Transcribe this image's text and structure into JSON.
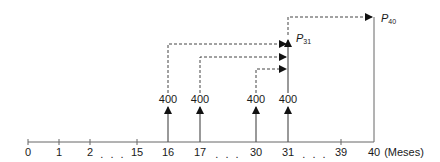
{
  "diagram": {
    "type": "cash-flow-timeline",
    "axis": {
      "unit_label": "(Meses)",
      "ticks": [
        {
          "label": "0",
          "x": 28
        },
        {
          "label": "1",
          "x": 59
        },
        {
          "label": "2",
          "x": 90
        },
        {
          "label": "15",
          "x": 137
        },
        {
          "label": "16",
          "x": 168
        },
        {
          "label": "17",
          "x": 200
        },
        {
          "label": "30",
          "x": 256
        },
        {
          "label": "31",
          "x": 288
        },
        {
          "label": "39",
          "x": 341
        },
        {
          "label": "40",
          "x": 374
        }
      ],
      "ellipses": [
        {
          "text": ". . .",
          "x": 113
        },
        {
          "text": ". . .",
          "x": 228
        },
        {
          "text": ". . .",
          "x": 315
        }
      ]
    },
    "deposits": [
      {
        "period": "16",
        "amount": "400",
        "x": 168
      },
      {
        "period": "17",
        "amount": "400",
        "x": 200
      },
      {
        "period": "30",
        "amount": "400",
        "x": 256
      },
      {
        "period": "31",
        "amount": "400",
        "x": 288
      }
    ],
    "values": {
      "p31": {
        "symbol": "P",
        "subscript": "31"
      },
      "p40": {
        "symbol": "P",
        "subscript": "40"
      }
    },
    "colors": {
      "line": "#555555",
      "arrow": "#111111",
      "text": "#1a1a1a"
    }
  }
}
